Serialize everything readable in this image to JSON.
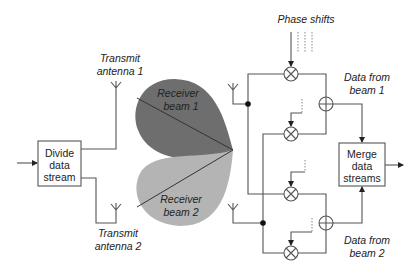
{
  "diagram": {
    "blocks": {
      "divide": {
        "lines": [
          "Divide",
          "data",
          "stream"
        ]
      },
      "merge": {
        "lines": [
          "Merge",
          "data",
          "streams"
        ]
      }
    },
    "labels": {
      "tx1": [
        "Transmit",
        "antenna 1"
      ],
      "tx2": [
        "Transmit",
        "antenna 2"
      ],
      "rx_beam1": [
        "Receiver",
        "beam 1"
      ],
      "rx_beam2": [
        "Receiver",
        "beam 2"
      ],
      "phase_shifts": "Phase shifts",
      "data_beam1": [
        "Data from",
        "beam 1"
      ],
      "data_beam2": [
        "Data from",
        "beam 2"
      ]
    },
    "colors": {
      "beam1": "#6e6e6e",
      "beam2": "#b4b4b4",
      "wire": "#555555",
      "node": "#111111"
    },
    "components": {
      "multipliers": 4,
      "adders": 2,
      "receive_antennas": 2,
      "transmit_antennas": 2
    }
  }
}
